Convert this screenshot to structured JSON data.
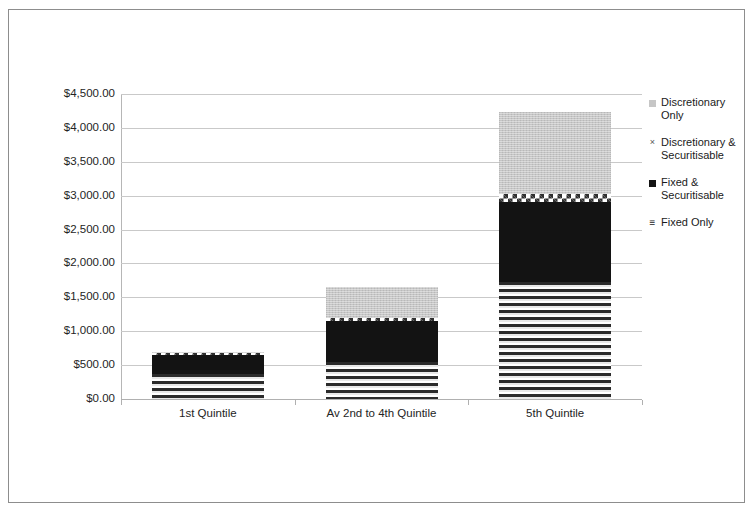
{
  "chart_data": {
    "type": "bar",
    "subtype": "stacked-bar",
    "title": "",
    "xlabel": "",
    "ylabel": "",
    "categories": [
      "1st Quintile",
      "Av 2nd to 4th Quintile",
      "5th Quintile"
    ],
    "series": [
      {
        "name": "Fixed Only",
        "marker": "horizontal-lines",
        "values": [
          370,
          545,
          1730
        ]
      },
      {
        "name": "Fixed & Securitisable",
        "marker": "filled-square",
        "values": [
          280,
          605,
          1170
        ]
      },
      {
        "name": "Discretionary & Securitisable",
        "marker": "x-mark",
        "values": [
          30,
          50,
          130
        ]
      },
      {
        "name": "Discretionary Only",
        "marker": "small-square",
        "values": [
          20,
          460,
          1200
        ]
      }
    ],
    "totals": [
      700,
      1660,
      4230
    ],
    "ylim": [
      0,
      4500
    ],
    "ytick_step": 500,
    "ytick_labels": [
      "$4,500.00",
      "$4,000.00",
      "$3,500.00",
      "$3,000.00",
      "$2,500.00",
      "$2,000.00",
      "$1,500.00",
      "$1,000.00",
      "$500.00",
      "$0.00"
    ],
    "ytick_values": [
      4500,
      4000,
      3500,
      3000,
      2500,
      2000,
      1500,
      1000,
      500,
      0
    ],
    "grid": true,
    "legend_position": "right",
    "legend": [
      {
        "label_line1": "Discretionary",
        "label_line2": "Only",
        "marker": "small-square",
        "color": "#c6c6c6"
      },
      {
        "label_line1": "Discretionary &",
        "label_line2": "Securitisable",
        "marker": "x-mark",
        "color": "#555555"
      },
      {
        "label_line1": "Fixed &",
        "label_line2": "Securitisable",
        "marker": "filled-square",
        "color": "#131313"
      },
      {
        "label_line1": "Fixed Only",
        "label_line2": "",
        "marker": "three-lines",
        "color": "#1a1a1a"
      }
    ],
    "glyphs": {
      "x_mark": "×",
      "three_lines": "≡"
    }
  }
}
